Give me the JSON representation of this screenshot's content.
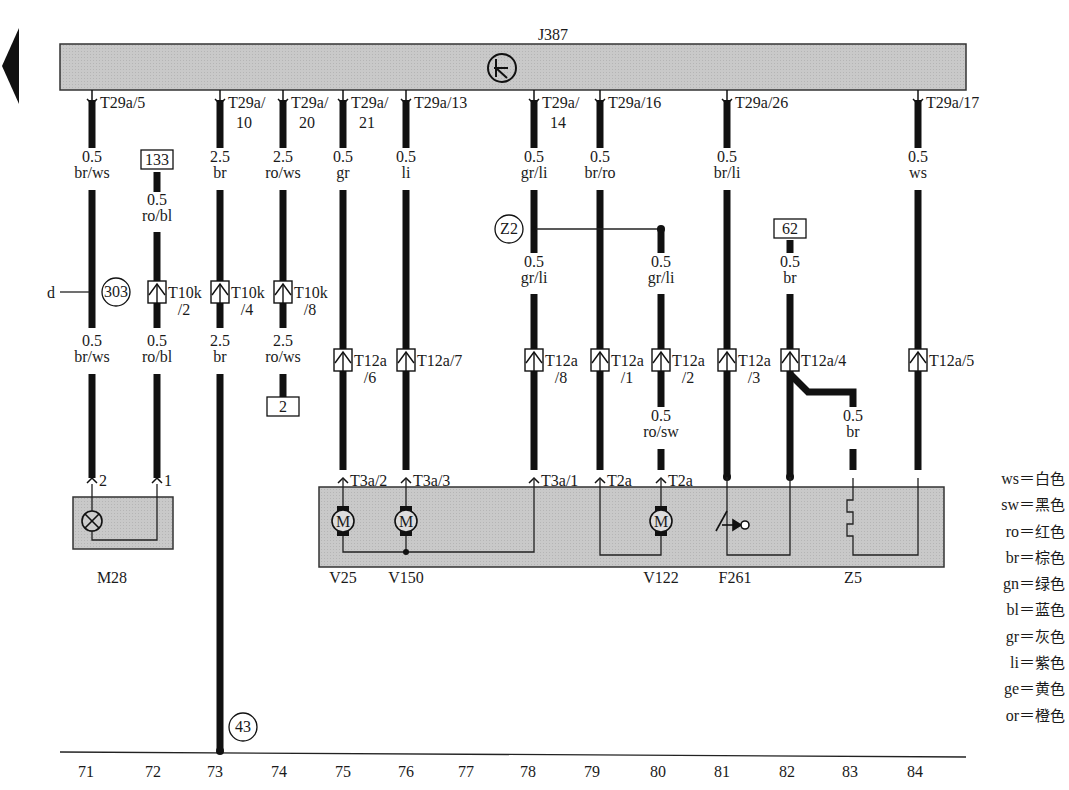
{
  "control_unit": {
    "id": "J387",
    "symbol": "clock-icon"
  },
  "back_arrow": "left-arrow-icon",
  "terminals": [
    {
      "x": 92,
      "l1": "T29a/5",
      "l2": ""
    },
    {
      "x": 220,
      "l1": "T29a/",
      "l2": "10"
    },
    {
      "x": 283,
      "l1": "T29a/",
      "l2": "20"
    },
    {
      "x": 343,
      "l1": "T29a/",
      "l2": "21"
    },
    {
      "x": 406,
      "l1": "T29a/13",
      "l2": ""
    },
    {
      "x": 534,
      "l1": "T29a/",
      "l2": "14"
    },
    {
      "x": 600,
      "l1": "T29a/16",
      "l2": ""
    },
    {
      "x": 727,
      "l1": "T29a/26",
      "l2": ""
    },
    {
      "x": 918,
      "l1": "T29a/17",
      "l2": ""
    }
  ],
  "wire_labels": [
    {
      "x": 92,
      "y": 162,
      "size": "0.5",
      "color": "br/ws"
    },
    {
      "x": 157,
      "y": 205,
      "size": "0.5",
      "color": "ro/bl"
    },
    {
      "x": 220,
      "y": 162,
      "size": "2.5",
      "color": "br"
    },
    {
      "x": 283,
      "y": 162,
      "size": "2.5",
      "color": "ro/ws"
    },
    {
      "x": 343,
      "y": 162,
      "size": "0.5",
      "color": "gr"
    },
    {
      "x": 406,
      "y": 162,
      "size": "0.5",
      "color": "li"
    },
    {
      "x": 534,
      "y": 162,
      "size": "0.5",
      "color": "gr/li"
    },
    {
      "x": 600,
      "y": 162,
      "size": "0.5",
      "color": "br/ro"
    },
    {
      "x": 727,
      "y": 162,
      "size": "0.5",
      "color": "br/li"
    },
    {
      "x": 918,
      "y": 162,
      "size": "0.5",
      "color": "ws"
    },
    {
      "x": 534,
      "y": 267,
      "size": "0.5",
      "color": "gr/li"
    },
    {
      "x": 661,
      "y": 267,
      "size": "0.5",
      "color": "gr/li"
    },
    {
      "x": 790,
      "y": 267,
      "size": "0.5",
      "color": "br"
    },
    {
      "x": 92,
      "y": 346,
      "size": "0.5",
      "color": "br/ws"
    },
    {
      "x": 157,
      "y": 346,
      "size": "0.5",
      "color": "ro/bl"
    },
    {
      "x": 220,
      "y": 346,
      "size": "2.5",
      "color": "br"
    },
    {
      "x": 283,
      "y": 346,
      "size": "2.5",
      "color": "ro/ws"
    },
    {
      "x": 661,
      "y": 421,
      "size": "0.5",
      "color": "ro/sw"
    },
    {
      "x": 853,
      "y": 421,
      "size": "0.5",
      "color": "br"
    }
  ],
  "boxed_refs": [
    {
      "x": 157,
      "y": 160,
      "label": "133"
    },
    {
      "x": 283,
      "y": 407,
      "label": "2"
    },
    {
      "x": 790,
      "y": 229,
      "label": "62"
    }
  ],
  "circled_refs": [
    {
      "x": 116,
      "y": 292,
      "label": "303"
    },
    {
      "x": 509,
      "y": 229,
      "label": "Z2"
    },
    {
      "x": 243,
      "y": 727,
      "label": "43"
    }
  ],
  "branch_letter": "d",
  "connectors": [
    {
      "x": 157,
      "y": 292,
      "l1": "T10k",
      "l2": "/2"
    },
    {
      "x": 220,
      "y": 292,
      "l1": "T10k",
      "l2": "/4"
    },
    {
      "x": 283,
      "y": 292,
      "l1": "T10k",
      "l2": "/8"
    },
    {
      "x": 343,
      "y": 360,
      "l1": "T12a",
      "l2": "/6"
    },
    {
      "x": 406,
      "y": 360,
      "l1": "T12a/7",
      "l2": ""
    },
    {
      "x": 534,
      "y": 360,
      "l1": "T12a",
      "l2": "/8"
    },
    {
      "x": 600,
      "y": 360,
      "l1": "T12a",
      "l2": "/1"
    },
    {
      "x": 661,
      "y": 360,
      "l1": "T12a",
      "l2": "/2"
    },
    {
      "x": 727,
      "y": 360,
      "l1": "T12a",
      "l2": "/3"
    },
    {
      "x": 790,
      "y": 360,
      "l1": "T12a/4",
      "l2": ""
    },
    {
      "x": 918,
      "y": 360,
      "l1": "T12a/5",
      "l2": ""
    }
  ],
  "component_pins": [
    {
      "x": 92,
      "label": "2"
    },
    {
      "x": 157,
      "label": "1"
    },
    {
      "x": 343,
      "label": "T3a/2"
    },
    {
      "x": 406,
      "label": "T3a/3"
    },
    {
      "x": 534,
      "label": "T3a/1"
    },
    {
      "x": 600,
      "label": "T2a"
    },
    {
      "x": 661,
      "label": "T2a"
    }
  ],
  "components": [
    {
      "id": "M28",
      "x": 112,
      "type": "lamp"
    },
    {
      "id": "V25",
      "x": 343,
      "type": "motor"
    },
    {
      "id": "V150",
      "x": 406,
      "type": "motor"
    },
    {
      "id": "V122",
      "x": 661,
      "type": "motor"
    },
    {
      "id": "F261",
      "x": 735,
      "type": "switch"
    },
    {
      "id": "Z5",
      "x": 853,
      "type": "heater"
    }
  ],
  "grid_numbers": [
    "71",
    "72",
    "73",
    "74",
    "75",
    "76",
    "77",
    "78",
    "79",
    "80",
    "81",
    "82",
    "83",
    "84"
  ],
  "legend": [
    {
      "code": "ws",
      "meaning": "白色"
    },
    {
      "code": "sw",
      "meaning": "黑色"
    },
    {
      "code": "ro",
      "meaning": "红色"
    },
    {
      "code": "br",
      "meaning": "棕色"
    },
    {
      "code": "gn",
      "meaning": "绿色"
    },
    {
      "code": "bl",
      "meaning": "蓝色"
    },
    {
      "code": "gr",
      "meaning": "灰色"
    },
    {
      "code": "li",
      "meaning": "紫色"
    },
    {
      "code": "ge",
      "meaning": "黄色"
    },
    {
      "code": "or",
      "meaning": "橙色"
    }
  ],
  "colors": {
    "module_fill": "#c8c8c8",
    "wire": "#111111",
    "line": "#222222"
  }
}
